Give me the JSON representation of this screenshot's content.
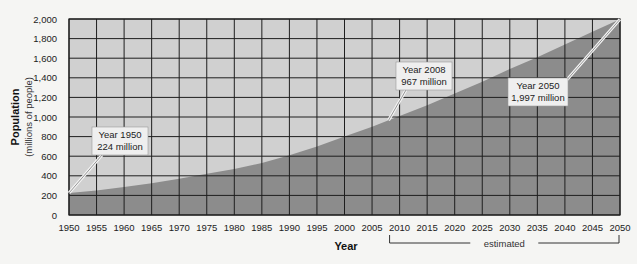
{
  "chart_data": {
    "type": "area",
    "title": "",
    "xlabel": "Year",
    "ylabel": "Population",
    "ylabel_sub": "(millions of people)",
    "xlim": [
      1950,
      2050
    ],
    "ylim": [
      0,
      2000
    ],
    "grid": true,
    "x_ticks": [
      1950,
      1955,
      1960,
      1965,
      1970,
      1975,
      1980,
      1985,
      1990,
      1995,
      2000,
      2005,
      2010,
      2015,
      2020,
      2025,
      2030,
      2035,
      2040,
      2045,
      2050
    ],
    "y_ticks": [
      0,
      200,
      400,
      600,
      800,
      1000,
      1200,
      1400,
      1600,
      1800,
      2000
    ],
    "y_tick_labels": [
      "0",
      "200",
      "400",
      "600",
      "800",
      "1,000",
      "1,200",
      "1,400",
      "1,600",
      "1,800",
      "2,000"
    ],
    "series": [
      {
        "name": "Population",
        "x": [
          1950,
          1955,
          1960,
          1965,
          1970,
          1975,
          1980,
          1985,
          1990,
          1995,
          2000,
          2005,
          2008,
          2010,
          2015,
          2020,
          2025,
          2030,
          2035,
          2040,
          2045,
          2050
        ],
        "values": [
          224,
          250,
          285,
          325,
          370,
          420,
          470,
          530,
          610,
          700,
          800,
          900,
          967,
          1010,
          1120,
          1240,
          1360,
          1490,
          1610,
          1740,
          1870,
          1997
        ]
      }
    ],
    "annotations": [
      {
        "id": "y1950",
        "line1": "Year 1950",
        "line2": "224 million",
        "x": 1950,
        "y": 224
      },
      {
        "id": "y2008",
        "line1": "Year 2008",
        "line2": "967 million",
        "x": 2008,
        "y": 967
      },
      {
        "id": "y2050",
        "line1": "Year 2050",
        "line2": "1,997 million",
        "x": 2050,
        "y": 1997
      }
    ],
    "estimated_range": {
      "from": 2008,
      "to": 2050,
      "label": "estimated"
    }
  },
  "colors": {
    "background": "#f5f5f3",
    "area_fill": "#8c8c8c",
    "plot_fill": "#d0d0d0",
    "grid": "#1e1e1e",
    "callout_bg": "#efefef"
  }
}
